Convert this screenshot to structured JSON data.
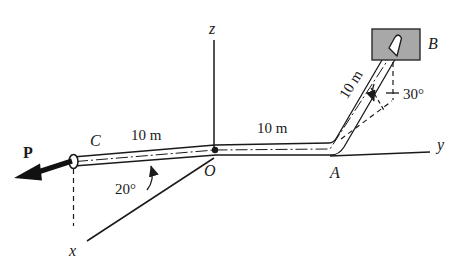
{
  "figure": {
    "background_color": "#ffffff",
    "ink_color": "#1a1a1a",
    "block_fill_color": "#a8a8a8",
    "block_stroke_color": "#2b2b2b"
  },
  "axes": {
    "x_label": "x",
    "y_label": "y",
    "z_label": "z"
  },
  "points": {
    "origin_label": "O",
    "a_label": "A",
    "b_label": "B",
    "c_label": "C"
  },
  "dimensions": {
    "segment_oc_length": "10 m",
    "segment_oa_length": "10 m",
    "segment_ab_length": "10 m"
  },
  "angles": {
    "oc_from_x_axis": "20°",
    "ab_from_vertical": "30°"
  },
  "force": {
    "label": "P",
    "applied_at": "C"
  }
}
